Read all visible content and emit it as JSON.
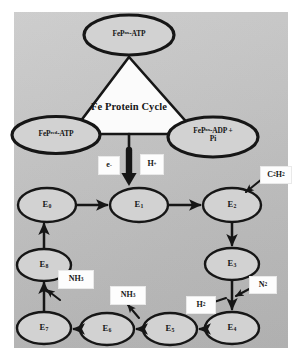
{
  "figure": {
    "background_color": "#c3c3c3",
    "ink_color": "#161616",
    "node_fill": "#d2d2d2",
    "panel_fill": "#ffffff"
  },
  "fe_protein_cycle": {
    "center_label": "Fe Protein Cycle",
    "nodes": [
      {
        "id": "fep-ox-atp",
        "label_html": "FeP<sup>ox</sup>-ATP",
        "position": "top"
      },
      {
        "id": "fep-red-atp",
        "label_html": "FeP<sup>red</sup>-ATP",
        "position": "bottom-left"
      },
      {
        "id": "fep-ox-adp-pi",
        "label_html": "FeP<sup>ox</sup>-ADP +<br>Pi",
        "position": "bottom-right"
      }
    ]
  },
  "transfer": {
    "electron_label_html": "e<sup>-</sup>",
    "proton_label_html": "H<sup>+</sup>",
    "arrow_direction": "down"
  },
  "e_cycle": {
    "nodes": [
      {
        "id": "E0",
        "label_html": "E<sub>0</sub>"
      },
      {
        "id": "E1",
        "label_html": "E<sub>1</sub>"
      },
      {
        "id": "E2",
        "label_html": "E<sub>2</sub>"
      },
      {
        "id": "E3",
        "label_html": "E<sub>3</sub>"
      },
      {
        "id": "E4",
        "label_html": "E<sub>4</sub>"
      },
      {
        "id": "E5",
        "label_html": "E<sub>5</sub>"
      },
      {
        "id": "E6",
        "label_html": "E<sub>6</sub>"
      },
      {
        "id": "E7",
        "label_html": "E<sub>7</sub>"
      },
      {
        "id": "E8",
        "label_html": "E<sub>8</sub>"
      }
    ],
    "sequence": [
      "E0",
      "E1",
      "E2",
      "E3",
      "E4",
      "E5",
      "E6",
      "E7",
      "E8",
      "E0"
    ]
  },
  "substrate_labels": [
    {
      "id": "c2h2",
      "label_html": "C<sub>2</sub>H<sub>2</sub>",
      "role": "substrate-in",
      "at_node": "E2"
    },
    {
      "id": "n2",
      "label_html": "N<sub>2</sub>",
      "role": "substrate-in",
      "at_edge": "E3-E4"
    },
    {
      "id": "h2",
      "label_html": "H<sub>2</sub>",
      "role": "product-out",
      "at_edge": "E3-E4"
    },
    {
      "id": "nh3a",
      "label_html": "NH<sub>3</sub>",
      "role": "product-out",
      "at_edge": "E5-E6"
    },
    {
      "id": "nh3b",
      "label_html": "NH<sub>3</sub>",
      "role": "product-out",
      "at_edge": "E7-E8"
    }
  ]
}
